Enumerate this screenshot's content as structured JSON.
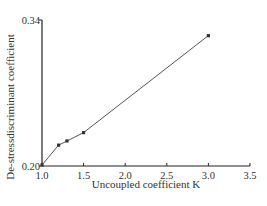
{
  "chart_data": {
    "type": "line",
    "title": "",
    "xlabel": "Uncoupled coefficient K",
    "ylabel": "De-stressdiscriminant coefficient",
    "xlim": [
      1.0,
      3.5
    ],
    "ylim": [
      0.2,
      0.34
    ],
    "x_ticks": [
      "1.0",
      "1.5",
      "2.0",
      "2.5",
      "3.0",
      "3.5"
    ],
    "y_ticks": [
      "0.20",
      "0.34"
    ],
    "grid": false,
    "legend": null,
    "series": [
      {
        "name": "De-stressdiscriminant coefficient",
        "x": [
          1.0,
          1.2,
          1.3,
          1.5,
          3.0
        ],
        "values": [
          0.201,
          0.22,
          0.224,
          0.232,
          0.325
        ],
        "color": "#555555",
        "marker": "square"
      }
    ]
  }
}
